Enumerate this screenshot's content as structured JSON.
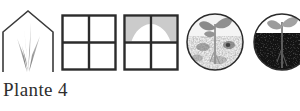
{
  "figure": {
    "caption": "Plante 4",
    "background_color": "#ffffff",
    "ink_color": "#2e2e2e",
    "icon_count": 5
  },
  "icons": [
    {
      "id": "greenhouse",
      "name": "greenhouse-with-grass-icon",
      "label": "Greenhouse outline with grass blades",
      "shape": "house-pentagon",
      "outline_color": "#3a3a3a",
      "fill_color": "#ffffff",
      "detail_color": "#8f8f8f"
    },
    {
      "id": "window-clear",
      "name": "window-four-pane-clear-icon",
      "label": "Four pane window, unshaded",
      "shape": "square-grid-2x2",
      "outline_color": "#2b2b2b",
      "fill_color": "#ffffff",
      "detail_color": "#ffffff"
    },
    {
      "id": "window-shaded",
      "name": "window-four-pane-shaded-icon",
      "label": "Four pane window, upper panes shaded",
      "shape": "square-grid-2x2",
      "outline_color": "#2b2b2b",
      "fill_color": "#ffffff",
      "detail_color": "#c9c9c9"
    },
    {
      "id": "soil-light",
      "name": "seedling-light-soil-icon",
      "label": "Circle, seedling in pale speckled soil",
      "shape": "circle",
      "outline_color": "#2b2b2b",
      "fill_color": "#f2f2f2",
      "detail_color": "#8a8a8a"
    },
    {
      "id": "soil-dark",
      "name": "seedling-dark-soil-icon",
      "label": "Circle, seedling in dark soil",
      "shape": "circle",
      "outline_color": "#2b2b2b",
      "fill_color": "#141414",
      "detail_color": "#9a9a9a"
    }
  ]
}
